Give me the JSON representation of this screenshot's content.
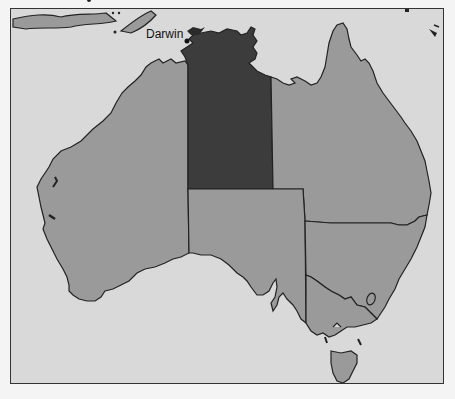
{
  "map": {
    "title": "Australia — Northern Territory highlighted",
    "highlighted_region": "Northern Territory",
    "labels": [
      {
        "name": "Darwin",
        "x": 145,
        "y": 37
      }
    ],
    "regions": [
      {
        "id": "wa",
        "name": "Western Australia",
        "fill": "#9a9a9a"
      },
      {
        "id": "nt",
        "name": "Northern Territory",
        "fill": "#3c3c3c"
      },
      {
        "id": "sa",
        "name": "South Australia",
        "fill": "#9a9a9a"
      },
      {
        "id": "qld",
        "name": "Queensland",
        "fill": "#9a9a9a"
      },
      {
        "id": "nsw",
        "name": "New South Wales",
        "fill": "#9a9a9a"
      },
      {
        "id": "vic",
        "name": "Victoria",
        "fill": "#9a9a9a"
      },
      {
        "id": "tas",
        "name": "Tasmania",
        "fill": "#9a9a9a"
      }
    ],
    "colors": {
      "sea": "#d9d9d9",
      "land": "#9a9a9a",
      "highlight": "#3c3c3c",
      "border": "#222222"
    }
  }
}
